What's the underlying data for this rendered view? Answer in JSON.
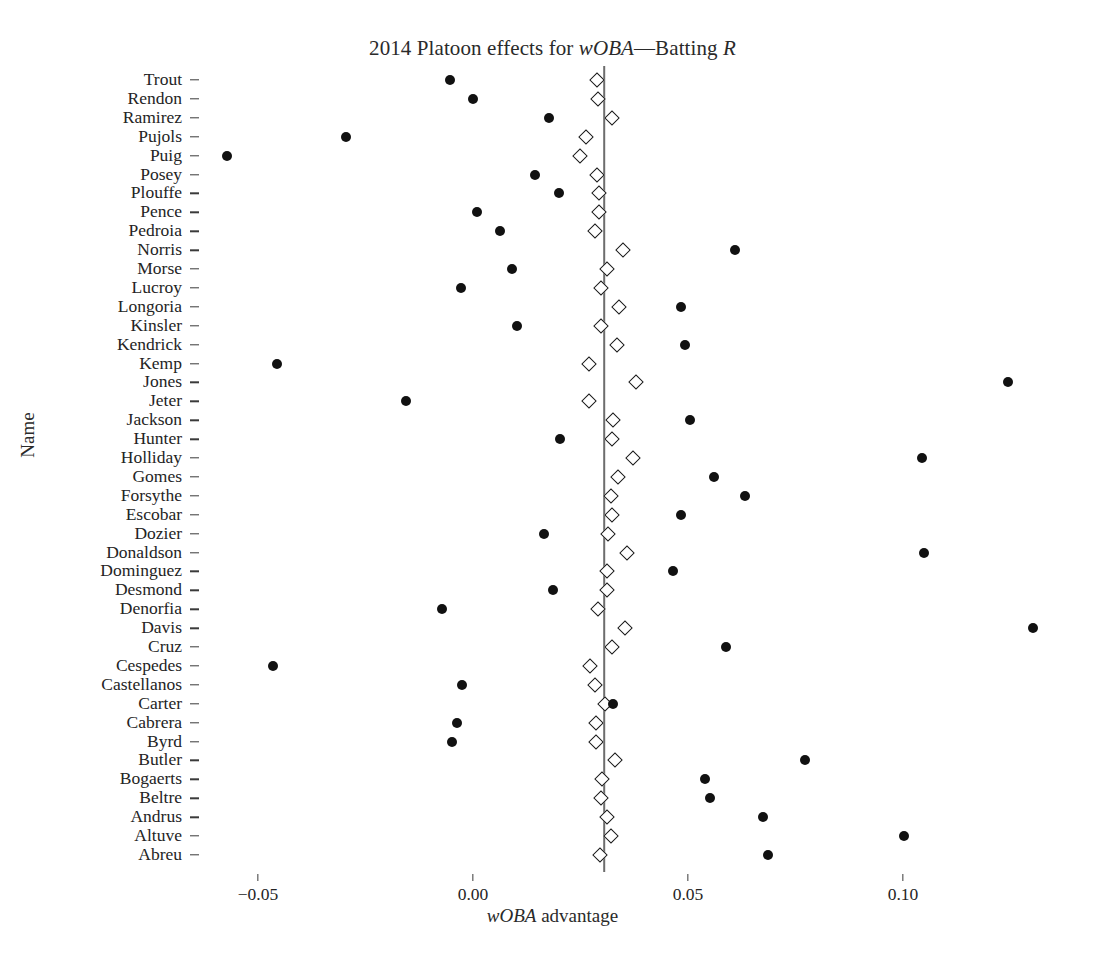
{
  "chart_data": {
    "type": "scatter",
    "title": "2014 Platoon effects for wOBA—Batting R",
    "title_parts": {
      "pre": "2014 Platoon effects for ",
      "italic1": "wOBA",
      "mid": "—Batting ",
      "italic2": "R"
    },
    "xlabel": "wOBA advantage",
    "xlabel_parts": {
      "italic": "wOBA",
      "rest": " advantage"
    },
    "ylabel": "Name",
    "grid": false,
    "legend": "none",
    "xlim": [
      -0.065,
      0.135
    ],
    "xticks": [
      -0.05,
      0.0,
      0.05,
      0.1
    ],
    "xtick_labels": [
      "−0.05",
      "0.00",
      "0.05",
      "0.10"
    ],
    "reference_line_x": 0.0305,
    "series": [
      {
        "name": "observed",
        "marker": "filled-circle",
        "color": "#111111"
      },
      {
        "name": "estimate",
        "marker": "open-diamond",
        "color": "#1a1a1a"
      }
    ],
    "categories": [
      "Trout",
      "Rendon",
      "Ramirez",
      "Pujols",
      "Puig",
      "Posey",
      "Plouffe",
      "Pence",
      "Pedroia",
      "Norris",
      "Morse",
      "Lucroy",
      "Longoria",
      "Kinsler",
      "Kendrick",
      "Kemp",
      "Jones",
      "Jeter",
      "Jackson",
      "Hunter",
      "Holliday",
      "Gomes",
      "Forsythe",
      "Escobar",
      "Dozier",
      "Donaldson",
      "Dominguez",
      "Desmond",
      "Denorfia",
      "Davis",
      "Cruz",
      "Cespedes",
      "Castellanos",
      "Carter",
      "Cabrera",
      "Byrd",
      "Butler",
      "Bogaerts",
      "Beltre",
      "Andrus",
      "Altuve",
      "Abreu"
    ],
    "points": [
      {
        "name": "Trout",
        "observed": -0.0053,
        "estimate": 0.0289
      },
      {
        "name": "Rendon",
        "observed": 0.0,
        "estimate": 0.0291
      },
      {
        "name": "Ramirez",
        "observed": 0.0177,
        "estimate": 0.0323
      },
      {
        "name": "Pujols",
        "observed": -0.0295,
        "estimate": 0.0263
      },
      {
        "name": "Puig",
        "observed": -0.0572,
        "estimate": 0.0249
      },
      {
        "name": "Posey",
        "observed": 0.0144,
        "estimate": 0.0289
      },
      {
        "name": "Plouffe",
        "observed": 0.02,
        "estimate": 0.0293
      },
      {
        "name": "Pence",
        "observed": 0.0009,
        "estimate": 0.0293
      },
      {
        "name": "Pedroia",
        "observed": 0.0063,
        "estimate": 0.0284
      },
      {
        "name": "Norris",
        "observed": 0.0609,
        "estimate": 0.0349
      },
      {
        "name": "Morse",
        "observed": 0.0091,
        "estimate": 0.0312
      },
      {
        "name": "Lucroy",
        "observed": -0.0028,
        "estimate": 0.0298
      },
      {
        "name": "Longoria",
        "observed": 0.0484,
        "estimate": 0.034
      },
      {
        "name": "Kinsler",
        "observed": 0.0102,
        "estimate": 0.0298
      },
      {
        "name": "Kendrick",
        "observed": 0.0493,
        "estimate": 0.0335
      },
      {
        "name": "Kemp",
        "observed": -0.0456,
        "estimate": 0.027
      },
      {
        "name": "Jones",
        "observed": 0.1244,
        "estimate": 0.0379
      },
      {
        "name": "Jeter",
        "observed": -0.0156,
        "estimate": 0.027
      },
      {
        "name": "Jackson",
        "observed": 0.0505,
        "estimate": 0.0326
      },
      {
        "name": "Hunter",
        "observed": 0.0202,
        "estimate": 0.0323
      },
      {
        "name": "Holliday",
        "observed": 0.1044,
        "estimate": 0.0372
      },
      {
        "name": "Gomes",
        "observed": 0.0561,
        "estimate": 0.0337
      },
      {
        "name": "Forsythe",
        "observed": 0.0633,
        "estimate": 0.0321
      },
      {
        "name": "Escobar",
        "observed": 0.0484,
        "estimate": 0.0323
      },
      {
        "name": "Dozier",
        "observed": 0.0165,
        "estimate": 0.0314
      },
      {
        "name": "Donaldson",
        "observed": 0.1049,
        "estimate": 0.0358
      },
      {
        "name": "Dominguez",
        "observed": 0.0465,
        "estimate": 0.0312
      },
      {
        "name": "Desmond",
        "observed": 0.0186,
        "estimate": 0.0312
      },
      {
        "name": "Denorfia",
        "observed": -0.0072,
        "estimate": 0.0291
      },
      {
        "name": "Davis",
        "observed": 0.1302,
        "estimate": 0.0353
      },
      {
        "name": "Cruz",
        "observed": 0.0588,
        "estimate": 0.0323
      },
      {
        "name": "Cespedes",
        "observed": -0.0465,
        "estimate": 0.0272
      },
      {
        "name": "Castellanos",
        "observed": -0.0026,
        "estimate": 0.0284
      },
      {
        "name": "Carter",
        "observed": 0.0326,
        "estimate": 0.0307
      },
      {
        "name": "Cabrera",
        "observed": -0.0037,
        "estimate": 0.0286
      },
      {
        "name": "Byrd",
        "observed": -0.0049,
        "estimate": 0.0286
      },
      {
        "name": "Butler",
        "observed": 0.0772,
        "estimate": 0.033
      },
      {
        "name": "Bogaerts",
        "observed": 0.054,
        "estimate": 0.03
      },
      {
        "name": "Beltre",
        "observed": 0.0551,
        "estimate": 0.0298
      },
      {
        "name": "Andrus",
        "observed": 0.0674,
        "estimate": 0.0312
      },
      {
        "name": "Altuve",
        "observed": 0.1002,
        "estimate": 0.0321
      },
      {
        "name": "Abreu",
        "observed": 0.0686,
        "estimate": 0.0296
      }
    ]
  },
  "axes": {
    "x_label_text": "wOBA advantage",
    "y_label_text": "Name"
  }
}
